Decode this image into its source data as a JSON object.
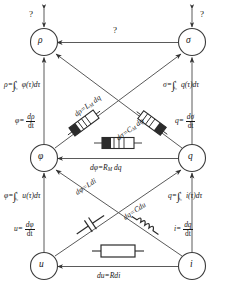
{
  "figure": {
    "style_note": "hand-drawn sketch"
  },
  "nodes": [
    {
      "id": "rho",
      "label": "ρ",
      "x": 44,
      "y": 42
    },
    {
      "id": "sigma",
      "label": "σ",
      "x": 192,
      "y": 42
    },
    {
      "id": "phi",
      "label": "φ",
      "x": 44,
      "y": 158
    },
    {
      "id": "q",
      "label": "q",
      "x": 192,
      "y": 158
    },
    {
      "id": "u",
      "label": "u",
      "x": 44,
      "y": 266
    },
    {
      "id": "i",
      "label": "i",
      "x": 192,
      "y": 266
    }
  ],
  "unknown_marks": {
    "top_left": "?",
    "top_right": "?",
    "top_middle": "?"
  },
  "edge_labels": {
    "rho_integral": {
      "lhs": "ρ=",
      "integrand": "φ(τ)dτ",
      "lower": "t₀",
      "upper": "t"
    },
    "sigma_integral": {
      "lhs": "σ=",
      "integrand": "q(τ)dτ",
      "lower": "t₀",
      "upper": "t"
    },
    "phi_integral": {
      "lhs": "φ=",
      "integrand": "u(τ)dτ",
      "lower": "t₀",
      "upper": "t"
    },
    "q_integral": {
      "lhs": "q=",
      "integrand": "i(τ)dτ",
      "lower": "t₀",
      "upper": "t"
    },
    "phi_derivative": {
      "lhs": "φ=",
      "num": "dρ",
      "den": "dt"
    },
    "q_derivative": {
      "lhs": "q=",
      "num": "dσ",
      "den": "dt"
    },
    "u_derivative": {
      "lhs": "u=",
      "num": "dφ",
      "den": "dt"
    },
    "i_derivative": {
      "lhs": "i=",
      "num": "dq",
      "den": "dt"
    },
    "memristor_M": {
      "text": "dφ=R",
      "sub": "M",
      "rest": " dq"
    },
    "meminductor": {
      "text": "dρ=L",
      "sub": "M",
      "rest": " dq"
    },
    "memcapacitor": {
      "text": "dσ=C",
      "sub": "M",
      "rest": " dφ"
    },
    "inductor": {
      "text": "dφ=Ldi"
    },
    "capacitor": {
      "text": "dq=Cdu"
    },
    "resistor": {
      "text": "du=Rdi"
    }
  },
  "components": [
    {
      "id": "meminductor-symbol",
      "kind": "meminductor"
    },
    {
      "id": "memcapacitor-symbol",
      "kind": "memcapacitor"
    },
    {
      "id": "memristor-symbol",
      "kind": "memristor"
    },
    {
      "id": "capacitor-symbol",
      "kind": "capacitor"
    },
    {
      "id": "inductor-symbol",
      "kind": "inductor"
    },
    {
      "id": "resistor-symbol",
      "kind": "resistor"
    }
  ],
  "colors": {
    "ink": "#161616",
    "line": "#555555",
    "background": "#ffffff"
  }
}
